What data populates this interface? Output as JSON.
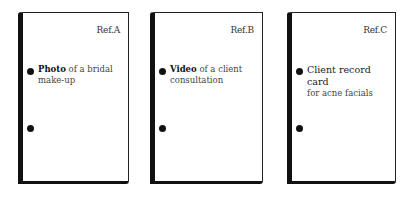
{
  "cards": [
    {
      "ref": "Ref.A",
      "title_strong": "Photo",
      "title_rest": " of a bridal make-up"
    },
    {
      "ref": "Ref.B",
      "title_strong": "Video",
      "title_rest": " of a client consultation"
    },
    {
      "ref": "Ref.C",
      "line1": "Client record card",
      "line2": "for acne facials"
    }
  ],
  "colors": {
    "border": "#111111",
    "dot": "#111111",
    "text": "#333333",
    "background": "#ffffff"
  }
}
